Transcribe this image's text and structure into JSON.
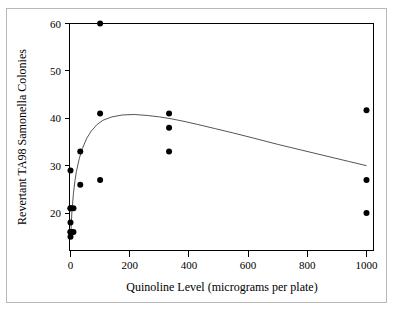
{
  "chart_data": {
    "type": "scatter",
    "title": "",
    "xlabel": "Quinoline Level (micrograms per plate)",
    "ylabel": "Revertant TA98 Samonella Colonies",
    "xlim": [
      -40,
      1060
    ],
    "ylim": [
      14,
      61.5
    ],
    "grid": false,
    "legend": null,
    "xticks": [
      0,
      200,
      400,
      600,
      800,
      1000
    ],
    "xticklabels": [
      "0",
      "200",
      "400",
      "600",
      "800",
      "1000"
    ],
    "yticks": [
      20,
      30,
      40,
      50,
      60
    ],
    "yticklabels": [
      "20",
      "30",
      "40",
      "50",
      "60"
    ],
    "points": [
      {
        "x": 0,
        "y": 15.0
      },
      {
        "x": 0,
        "y": 16.0
      },
      {
        "x": 0,
        "y": 16.0
      },
      {
        "x": 0,
        "y": 18.0
      },
      {
        "x": 0,
        "y": 21.0
      },
      {
        "x": 0,
        "y": 21.0
      },
      {
        "x": 0,
        "y": 29.0
      },
      {
        "x": 10,
        "y": 16.0
      },
      {
        "x": 10,
        "y": 21.0
      },
      {
        "x": 33,
        "y": 26.0
      },
      {
        "x": 33,
        "y": 33.0
      },
      {
        "x": 100,
        "y": 27.0
      },
      {
        "x": 100,
        "y": 41.0
      },
      {
        "x": 100,
        "y": 60.0
      },
      {
        "x": 333,
        "y": 33.0
      },
      {
        "x": 333,
        "y": 38.0
      },
      {
        "x": 333,
        "y": 41.0
      },
      {
        "x": 1000,
        "y": 20.0
      },
      {
        "x": 1000,
        "y": 27.0
      },
      {
        "x": 1000,
        "y": 41.7
      }
    ],
    "series": [
      {
        "name": "fitted-curve",
        "type": "line",
        "x": [
          0,
          5,
          10,
          15,
          20,
          30,
          40,
          55,
          70,
          90,
          110,
          140,
          175,
          215,
          260,
          300,
          340,
          380,
          430,
          490,
          550,
          620,
          700,
          780,
          860,
          940,
          1000
        ],
        "y": [
          14.6,
          20.5,
          24.2,
          26.8,
          28.8,
          31.6,
          33.6,
          35.8,
          37.3,
          38.7,
          39.6,
          40.3,
          40.7,
          40.8,
          40.6,
          40.3,
          39.9,
          39.4,
          38.7,
          37.8,
          36.9,
          35.8,
          34.5,
          33.3,
          32.1,
          30.9,
          30.0
        ]
      }
    ]
  },
  "axes": {
    "x_title": "Quinoline Level (micrograms per plate)",
    "y_title": "Revertant TA98 Samonella Colonies"
  },
  "tick_labels": {
    "x": [
      "0",
      "200",
      "400",
      "600",
      "800",
      "1000"
    ],
    "y": [
      "20",
      "30",
      "40",
      "50",
      "60"
    ]
  },
  "style": {
    "point_color": "#000000",
    "curve_color": "#555555",
    "axis_color": "#000000",
    "frame_color": "#b9b9b9",
    "background": "#ffffff"
  }
}
